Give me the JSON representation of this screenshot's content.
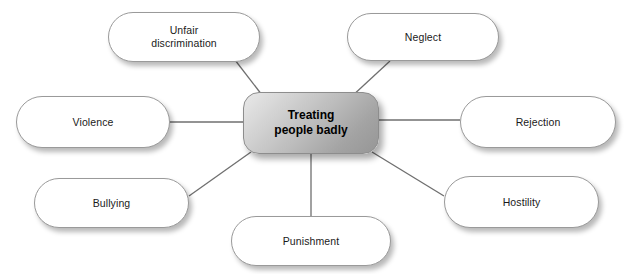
{
  "diagram": {
    "type": "mind-map",
    "title": "Treating people badly",
    "canvas": {
      "width": 628,
      "height": 274
    },
    "center": {
      "id": "center",
      "label": "Treating\npeople badly",
      "x": 243,
      "y": 92,
      "w": 136,
      "h": 62,
      "fill_start": "#e9e9e9",
      "fill_end": "#969696",
      "border": "#8d8d8d",
      "text_color": "#000000"
    },
    "branches": [
      {
        "id": "unfair-discrimination",
        "label": "Unfair\ndiscrimination",
        "x": 108,
        "y": 12,
        "w": 152,
        "h": 50,
        "anchor_x": 235,
        "anchor_y": 60,
        "center_x": 262,
        "center_y": 95
      },
      {
        "id": "neglect",
        "label": "Neglect",
        "x": 347,
        "y": 13,
        "w": 152,
        "h": 48,
        "anchor_x": 390,
        "anchor_y": 61,
        "center_x": 350,
        "center_y": 98
      },
      {
        "id": "violence",
        "label": "Violence",
        "x": 16,
        "y": 96,
        "w": 154,
        "h": 52,
        "anchor_x": 170,
        "anchor_y": 122,
        "center_x": 243,
        "center_y": 122
      },
      {
        "id": "rejection",
        "label": "Rejection",
        "x": 460,
        "y": 96,
        "w": 156,
        "h": 52,
        "anchor_x": 460,
        "anchor_y": 120,
        "center_x": 379,
        "center_y": 120
      },
      {
        "id": "bullying",
        "label": "Bullying",
        "x": 34,
        "y": 178,
        "w": 155,
        "h": 50,
        "anchor_x": 189,
        "anchor_y": 196,
        "center_x": 251,
        "center_y": 152
      },
      {
        "id": "hostility",
        "label": "Hostility",
        "x": 444,
        "y": 176,
        "w": 155,
        "h": 52,
        "anchor_x": 444,
        "anchor_y": 196,
        "center_x": 372,
        "center_y": 152
      },
      {
        "id": "punishment",
        "label": "Punishment",
        "x": 231,
        "y": 216,
        "w": 160,
        "h": 50,
        "anchor_x": 311,
        "anchor_y": 216,
        "center_x": 311,
        "center_y": 154
      }
    ],
    "style": {
      "connector_color": "#6f6f6f",
      "connector_width": 1.3,
      "node_fill": "#ffffff",
      "node_border": "#9a9a9a",
      "background": "#ffffff"
    }
  }
}
